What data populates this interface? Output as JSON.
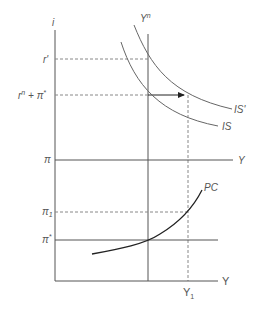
{
  "diagram": {
    "type": "IS-MP / Phillips curve diagram",
    "colors": {
      "axis": "#555555",
      "dashed": "#888888",
      "curve": "#666666",
      "pc_curve": "#222222",
      "arrow": "#222222"
    },
    "top_panel": {
      "y_axis_label": "i",
      "tick_labels": {
        "r_prime": "r'",
        "rn_plus_pistar": "rⁿ + π*",
        "pi": "π"
      },
      "vertical_line_label": "Yⁿ",
      "curves": {
        "is": "IS",
        "is_prime": "IS'"
      },
      "horizontal_axis_label": "Y",
      "arrow": "shift from Yⁿ to Y₁ at rⁿ + π*"
    },
    "bottom_panel": {
      "tick_labels": {
        "pi_1": "π1",
        "pi_star": "π*"
      },
      "curve_label": "PC",
      "x_axis_label": "Y",
      "x_tick": "Y₁"
    }
  }
}
